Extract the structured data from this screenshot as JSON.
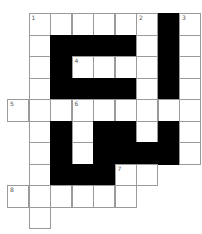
{
  "puzzle": {
    "type": "crossword",
    "cols": 9,
    "rows": 10,
    "cell_size": 21.5,
    "colors": {
      "white_cell": "#ffffff",
      "black_cell": "#000000",
      "border": "#9a9a9a",
      "number": "#555555"
    },
    "layout": [
      "-WWWWWWBW",
      "-WBBBBWBW",
      "-WBWWWWBW",
      "-WBBBBWBW",
      "WWWWWWWWW",
      "-WBWBBWBW",
      "-WBWBBBBW",
      "-WBBBWW--",
      "WWWWWW---",
      "-W-------"
    ],
    "numbers": [
      {
        "label": "1",
        "row": 0,
        "col": 1
      },
      {
        "label": "2",
        "row": 0,
        "col": 6
      },
      {
        "label": "3",
        "row": 0,
        "col": 8
      },
      {
        "label": "4",
        "row": 2,
        "col": 3
      },
      {
        "label": "5",
        "row": 4,
        "col": 0
      },
      {
        "label": "6",
        "row": 4,
        "col": 3
      },
      {
        "label": "7",
        "row": 7,
        "col": 5
      },
      {
        "label": "8",
        "row": 8,
        "col": 0
      }
    ]
  }
}
